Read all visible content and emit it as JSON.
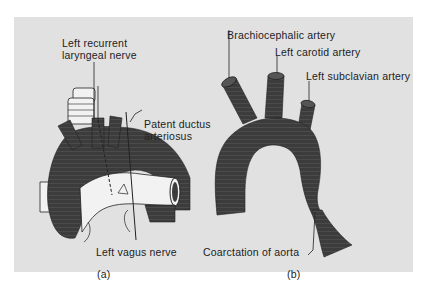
{
  "figure": {
    "panel_a": {
      "caption": "(a)",
      "labels": {
        "recurrent_line1": "Left recurrent",
        "recurrent_line2": "laryngeal nerve",
        "ductus_line1": "Patent ductus",
        "ductus_line2": "arteriosus",
        "vagus": "Left vagus nerve"
      }
    },
    "panel_b": {
      "caption": "(b)",
      "labels": {
        "brachiocephalic": "Brachiocephalic artery",
        "carotid": "Left carotid artery",
        "subclavian": "Left subclavian artery",
        "coarctation": "Coarctation of aorta"
      }
    },
    "colors": {
      "background": "#e1e1e1",
      "vessel": "#3c3c3c",
      "vessel_light": "#f2f2f2",
      "line": "#222222"
    }
  }
}
